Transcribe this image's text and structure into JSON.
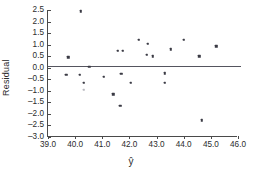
{
  "chart_data": {
    "type": "scatter",
    "title": "",
    "xlabel": "ŷ",
    "ylabel": "Residual",
    "xlim": [
      39.0,
      46.0
    ],
    "ylim": [
      -3.0,
      2.5
    ],
    "xticks": [
      "39.0",
      "40.0",
      "41.0",
      "42.0",
      "43.0",
      "44.0",
      "45.0",
      "46.0"
    ],
    "xtick_values": [
      39.0,
      40.0,
      41.0,
      42.0,
      43.0,
      44.0,
      45.0,
      46.0
    ],
    "yticks": [
      "2.5",
      "2.0",
      "1.5",
      "1.0",
      "0.5",
      "0.0",
      "-0.5",
      "-1.0",
      "-1.5",
      "-2.0",
      "-2.5",
      "-3.0"
    ],
    "ytick_values": [
      2.5,
      2.0,
      1.5,
      1.0,
      0.5,
      0.0,
      -0.5,
      -1.0,
      -1.5,
      -2.0,
      -2.5,
      -3.0
    ],
    "grid": false,
    "legend": "none",
    "reference_line": {
      "y": 0.05,
      "x_start": 39.0,
      "x_end": 46.1,
      "color": "#55555f"
    },
    "marker_color": "#3a3a44",
    "x": [
      40.2,
      39.75,
      39.68,
      40.18,
      40.32,
      40.52,
      40.33,
      41.05,
      41.4,
      41.66,
      41.58,
      41.76,
      41.7,
      42.05,
      42.35,
      42.68,
      42.64,
      42.86,
      43.3,
      43.3,
      43.52,
      44.0,
      44.58,
      44.66,
      45.2
    ],
    "y": [
      2.45,
      0.45,
      -0.3,
      -0.3,
      -0.66,
      0.05,
      -0.95,
      -0.4,
      -1.15,
      -1.65,
      0.74,
      0.74,
      -0.26,
      -0.66,
      1.2,
      1.04,
      0.56,
      0.5,
      -0.24,
      -0.66,
      0.8,
      1.2,
      0.5,
      -2.28,
      0.92
    ],
    "faint_indices": [
      6
    ],
    "n_points": 25
  }
}
